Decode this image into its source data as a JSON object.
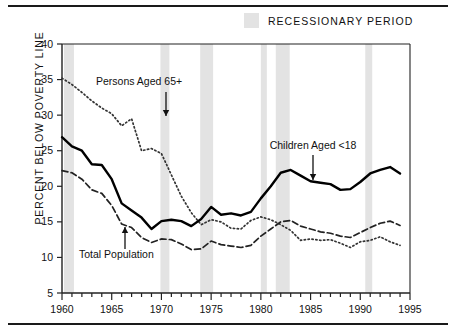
{
  "legend": {
    "swatch_color": "#e3e3e3",
    "label": "RECESSIONARY PERIOD"
  },
  "axis": {
    "ylabel": "PERCENT BELOW POVERTY LINE",
    "ytick_labels": [
      "40",
      "35",
      "30",
      "25",
      "20",
      "15",
      "10",
      "5"
    ],
    "xtick_labels": [
      "1960",
      "1965",
      "1970",
      "1975",
      "1980",
      "1985",
      "1990",
      "1995"
    ]
  },
  "annotations": [
    {
      "text": "Persons Aged 65+",
      "name": "annotation-persons-65-plus"
    },
    {
      "text": "Total Population",
      "name": "annotation-total-population"
    },
    {
      "text": "Children Aged <18",
      "name": "annotation-children-under-18"
    }
  ],
  "chart_data": {
    "type": "line",
    "title": "",
    "xlabel": "",
    "ylabel": "PERCENT BELOW POVERTY LINE",
    "xlim": [
      1960,
      1995
    ],
    "ylim": [
      5,
      40
    ],
    "yticks": [
      5,
      10,
      15,
      20,
      25,
      30,
      35,
      40
    ],
    "xticks": [
      1960,
      1965,
      1970,
      1975,
      1980,
      1985,
      1990,
      1995
    ],
    "xtick_minor_step": 1,
    "grid": false,
    "legend_position": "top-right",
    "x": [
      1960,
      1961,
      1962,
      1963,
      1964,
      1965,
      1966,
      1967,
      1968,
      1969,
      1970,
      1971,
      1972,
      1973,
      1974,
      1975,
      1976,
      1977,
      1978,
      1979,
      1980,
      1981,
      1982,
      1983,
      1984,
      1985,
      1986,
      1987,
      1988,
      1989,
      1990,
      1991,
      1992,
      1993,
      1994
    ],
    "series": [
      {
        "name": "Persons Aged 65+",
        "style": "dotted",
        "color": "#333333",
        "values": [
          35.2,
          34.3,
          33.2,
          32.0,
          31.0,
          30.2,
          28.5,
          29.5,
          25.0,
          25.3,
          24.6,
          21.6,
          18.6,
          16.3,
          14.6,
          15.3,
          15.0,
          14.1,
          14.0,
          15.2,
          15.7,
          15.3,
          14.6,
          13.8,
          12.4,
          12.6,
          12.4,
          12.5,
          12.0,
          11.4,
          12.2,
          12.4,
          12.9,
          12.2,
          11.7
        ]
      },
      {
        "name": "Total Population",
        "style": "dashed",
        "color": "#222222",
        "values": [
          22.2,
          21.9,
          21.0,
          19.5,
          19.0,
          17.3,
          14.7,
          14.2,
          12.8,
          12.1,
          12.6,
          12.5,
          11.9,
          11.1,
          11.2,
          12.3,
          11.8,
          11.6,
          11.4,
          11.7,
          13.0,
          14.0,
          15.0,
          15.2,
          14.4,
          14.0,
          13.6,
          13.4,
          13.0,
          12.8,
          13.5,
          14.2,
          14.8,
          15.1,
          14.5
        ]
      },
      {
        "name": "Children Aged <18",
        "style": "solid",
        "color": "#000000",
        "values": [
          26.9,
          25.6,
          25.0,
          23.1,
          23.0,
          21.0,
          17.6,
          16.6,
          15.6,
          14.0,
          15.1,
          15.3,
          15.1,
          14.4,
          15.4,
          17.1,
          16.0,
          16.2,
          15.9,
          16.4,
          18.3,
          20.0,
          21.9,
          22.3,
          21.5,
          20.7,
          20.5,
          20.3,
          19.5,
          19.6,
          20.6,
          21.8,
          22.3,
          22.7,
          21.8
        ]
      }
    ],
    "recession_bands": [
      {
        "start": 1960.2,
        "end": 1961.2
      },
      {
        "start": 1969.9,
        "end": 1970.8
      },
      {
        "start": 1973.9,
        "end": 1975.2
      },
      {
        "start": 1980.0,
        "end": 1980.6
      },
      {
        "start": 1981.5,
        "end": 1982.9
      },
      {
        "start": 1990.5,
        "end": 1991.2
      }
    ]
  }
}
